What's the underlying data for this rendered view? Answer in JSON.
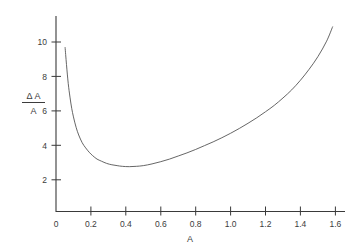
{
  "figure": {
    "background_color": "#ffffff",
    "line_color": "#555555",
    "axis_color": "#3a3a3a",
    "text_color": "#3c3c3c"
  },
  "ylabel": {
    "numerator": "Δ A",
    "denominator": "A"
  },
  "xlabel": "A",
  "chart_data": {
    "type": "line",
    "title": "",
    "xlabel": "A",
    "ylabel": "ΔA/A",
    "xlim": [
      0,
      1.65
    ],
    "ylim": [
      0,
      11.4
    ],
    "grid": false,
    "legend": null,
    "xticks": [
      0,
      0.2,
      0.4,
      0.6,
      0.8,
      1.0,
      1.2,
      1.4,
      1.6
    ],
    "xticklabels": [
      "0",
      "0.2",
      "0.4",
      "0.6",
      "0.8",
      "1.0",
      "1.2",
      "1.4",
      "1.6"
    ],
    "yticks": [
      2,
      4,
      6,
      8,
      10
    ],
    "yticklabels": [
      "2",
      "4",
      "6",
      "8",
      "10"
    ],
    "series": [
      {
        "name": "ΔA/A",
        "x": [
          0.052,
          0.06,
          0.07,
          0.08,
          0.09,
          0.1,
          0.115,
          0.13,
          0.15,
          0.17,
          0.19,
          0.21,
          0.235,
          0.26,
          0.29,
          0.32,
          0.35,
          0.38,
          0.42,
          0.46,
          0.5,
          0.55,
          0.6,
          0.65,
          0.7,
          0.75,
          0.8,
          0.85,
          0.9,
          0.95,
          1.0,
          1.05,
          1.1,
          1.15,
          1.2,
          1.25,
          1.3,
          1.35,
          1.4,
          1.45,
          1.5,
          1.55,
          1.585
        ],
        "y": [
          9.7,
          8.7,
          7.6,
          6.8,
          6.15,
          5.65,
          5.05,
          4.6,
          4.15,
          3.85,
          3.6,
          3.4,
          3.2,
          3.08,
          2.95,
          2.87,
          2.82,
          2.78,
          2.76,
          2.78,
          2.82,
          2.92,
          3.05,
          3.2,
          3.38,
          3.56,
          3.76,
          3.98,
          4.2,
          4.44,
          4.7,
          4.98,
          5.28,
          5.6,
          5.95,
          6.32,
          6.75,
          7.22,
          7.78,
          8.42,
          9.15,
          10.05,
          10.9
        ],
        "minimum": {
          "x": 0.42,
          "y": 2.76
        }
      }
    ]
  }
}
